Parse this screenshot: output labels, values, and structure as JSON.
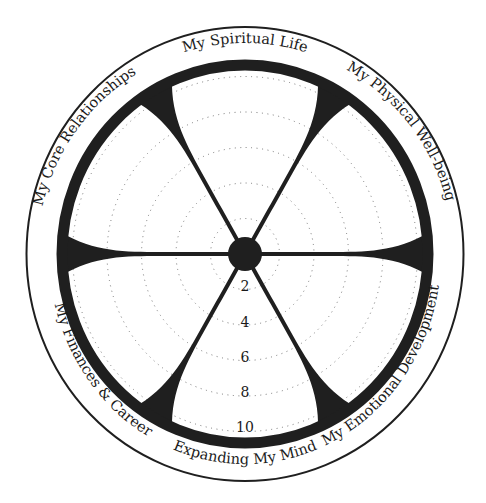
{
  "diagram": {
    "type": "wheel",
    "center": [
      245,
      254
    ],
    "segments": [
      {
        "label": "My Spiritual Life",
        "position": "top"
      },
      {
        "label": "My Physical Well-being",
        "position": "upper-right"
      },
      {
        "label": "My Emotional Development",
        "position": "lower-right"
      },
      {
        "label": "Expanding My Mind",
        "position": "bottom"
      },
      {
        "label": "My Finances & Career",
        "position": "lower-left"
      },
      {
        "label": "My Core Relationships",
        "position": "upper-left"
      }
    ],
    "scale": {
      "labels": [
        "2",
        "4",
        "6",
        "8",
        "10"
      ],
      "min": 0,
      "max": 10
    },
    "colors": {
      "ink": "#1f1f1f",
      "background": "#ffffff",
      "grid": "#777777"
    }
  }
}
